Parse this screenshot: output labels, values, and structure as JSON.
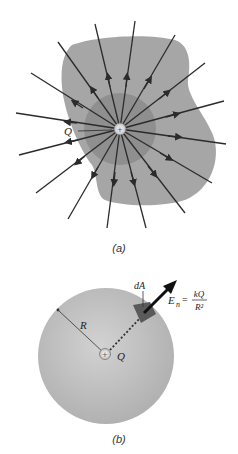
{
  "figure_a": {
    "caption": "(a)",
    "charge_label": "Q",
    "charge_sign": "+",
    "field_line_count": 16,
    "colors": {
      "surface": "#a6a6a6",
      "inner_region": "#8f8f8f",
      "lines": "#2b2b2b"
    }
  },
  "figure_b": {
    "caption": "(b)",
    "radius_label": "R",
    "charge_label": "Q",
    "charge_sign": "+",
    "area_label": "dA",
    "field_label_lhs": "E",
    "field_label_sub": "n",
    "field_label_eq": "=",
    "field_numerator": "kQ",
    "field_denominator": "R²",
    "colors": {
      "sphere": "#bdbdbd",
      "patch": "#5a5a5a",
      "arrow": "#111111"
    }
  }
}
